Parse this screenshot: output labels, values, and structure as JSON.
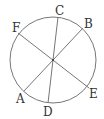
{
  "diagram": {
    "circle": {
      "cx": 53,
      "cy": 60,
      "r": 43,
      "stroke": "#777777"
    },
    "center": {
      "x": 53,
      "y": 60
    },
    "chords": [
      {
        "name": "CD",
        "from": "C",
        "to": "D"
      },
      {
        "name": "BA",
        "from": "B",
        "to": "A"
      },
      {
        "name": "FE",
        "from": "F",
        "to": "E"
      }
    ],
    "points": {
      "C": {
        "label": "C",
        "x": 58,
        "y": 17,
        "lx": 55,
        "ly": 15
      },
      "B": {
        "label": "B",
        "x": 83,
        "y": 28,
        "lx": 84,
        "ly": 28
      },
      "F": {
        "label": "F",
        "x": 18,
        "y": 33,
        "lx": 12,
        "ly": 32
      },
      "A": {
        "label": "A",
        "x": 24,
        "y": 91,
        "lx": 16,
        "ly": 103
      },
      "D": {
        "label": "D",
        "x": 48,
        "y": 103,
        "lx": 43,
        "ly": 116
      },
      "E": {
        "label": "E",
        "x": 89,
        "y": 88,
        "lx": 89,
        "ly": 98
      }
    }
  }
}
